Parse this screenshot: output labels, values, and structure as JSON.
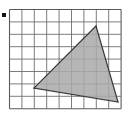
{
  "figure": {
    "title": "Shaded triangle on square grid",
    "background_color": "#ffffff",
    "width": 134,
    "height": 118
  },
  "grid": {
    "name": "square-grid",
    "columns": 9,
    "rows": 8,
    "cell_size": 12.4,
    "origin_x": 9.5,
    "origin_y": 9.5,
    "line_color": "#6e6e6e",
    "line_width": 0.9,
    "border_color": "#5a5a5a",
    "border_width": 1.1
  },
  "triangle": {
    "name": "shaded-triangle",
    "fill_color": "#a9a9a9",
    "fill_opacity": 0.85,
    "stroke_color": "#3a3a3a",
    "stroke_width": 1.2,
    "vertices": [
      {
        "label": "top",
        "x": 96,
        "y": 26,
        "grid_col": 7,
        "grid_row": 1.3
      },
      {
        "label": "bottom-right",
        "x": 118,
        "y": 102,
        "grid_col": 8.8,
        "grid_row": 7.5
      },
      {
        "label": "left",
        "x": 34,
        "y": 88,
        "grid_col": 2,
        "grid_row": 6.3
      }
    ],
    "vertex_count": 3
  },
  "marker": {
    "name": "edge-marker",
    "shape": "square",
    "x": 2,
    "y": 13,
    "size": 4,
    "color": "#141414"
  },
  "labels": {
    "caption": "",
    "axis_x": "",
    "axis_y": ""
  }
}
